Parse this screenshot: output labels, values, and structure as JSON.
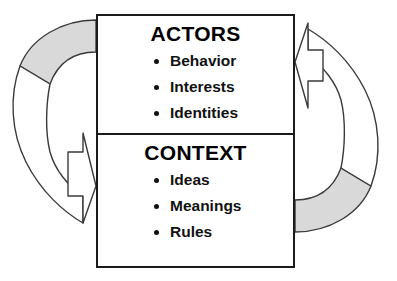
{
  "diagram": {
    "colors": {
      "band_fill": "#d9d9d9",
      "outline": "#3a3a3a",
      "box_border": "#1b1b1b",
      "text": "#111111",
      "background": "#ffffff"
    },
    "panels": [
      {
        "id": "actors",
        "heading": "ACTORS",
        "items": [
          "Behavior",
          "Interests",
          "Identities"
        ]
      },
      {
        "id": "context",
        "heading": "CONTEXT",
        "items": [
          "Ideas",
          "Meanings",
          "Rules"
        ]
      }
    ],
    "arrows": [
      {
        "id": "left-arrow",
        "name": "actors-to-context-arrow",
        "from": "ACTORS",
        "to": "CONTEXT",
        "direction": "counter-clockwise-left",
        "points_to": "right",
        "shaded": true
      },
      {
        "id": "right-arrow",
        "name": "context-to-actors-arrow",
        "from": "CONTEXT",
        "to": "ACTORS",
        "direction": "counter-clockwise-right",
        "points_to": "left",
        "shaded": true
      }
    ]
  }
}
